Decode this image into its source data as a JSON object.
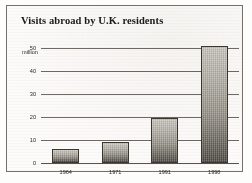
{
  "chart_data": {
    "type": "bar",
    "title": "Visits abroad by U.K. residents",
    "xlabel": "",
    "ylabel": "million",
    "categories": [
      "1964",
      "1971",
      "1991",
      "1998"
    ],
    "values": [
      6,
      9,
      19.5,
      51
    ],
    "ylim": [
      0,
      55
    ],
    "yticks": [
      0,
      10,
      20,
      30,
      40,
      50
    ],
    "ytick_labels": [
      "0",
      "10",
      "20",
      "30",
      "40",
      "50"
    ],
    "grid": true,
    "legend": null,
    "unit_note": "million",
    "colors": {
      "bar_top": "#cfccc4",
      "bar_bottom": "#4c4942",
      "bar_border": "#3a372f",
      "gridline": "#6f6a62",
      "text": "#1b1a18",
      "frame": "#777067",
      "background": "#fcfbf9"
    }
  }
}
